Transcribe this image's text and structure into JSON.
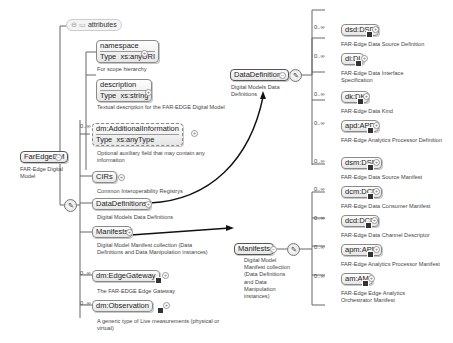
{
  "root": {
    "name": "FarEdgeDM",
    "doc": "FAR-Edge Digital Model"
  },
  "attributes": {
    "label": "attributes"
  },
  "root_children": [
    {
      "name": "namespace",
      "type_label": "Type",
      "type": "xs:anyURI",
      "doc": "For scope hierarchy",
      "occurs": ""
    },
    {
      "name": "description",
      "type_label": "Type",
      "type": "xs:string",
      "doc": "Textual description for the FAR-EDGE Digital Model",
      "occurs": ""
    },
    {
      "name": "dm:AdditionalInformation",
      "type_label": "Type",
      "type": "xs:anyType",
      "doc": "Optional auxiliary field that may contain any information",
      "occurs": "0..∞"
    },
    {
      "name": "CIRs",
      "doc": "Common Interoperability Registrys",
      "occurs": ""
    },
    {
      "name": "DataDefinitions",
      "doc": "Digital Models Data Definitions",
      "occurs": ""
    },
    {
      "name": "Manifests",
      "doc": "Digital Model Manifest collection (Data Definitions and Data Manipulation instances)",
      "occurs": ""
    },
    {
      "name": "dm:EdgeGateway",
      "doc": "The FAR-EDGE Edge Gateway",
      "occurs": "0..∞"
    },
    {
      "name": "dm:Observation",
      "doc": "A generic type of Live measurements (physical or virtual)",
      "occurs": "0..∞"
    }
  ],
  "data_definitions": {
    "name": "DataDefinitions",
    "doc": "Digital Models Data Definitions",
    "children": [
      {
        "name": "dsd:DSD",
        "doc": "FAR-Edge Data Source Definition",
        "occurs": "0..∞"
      },
      {
        "name": "di:DI",
        "doc": "FAR-Edge Data Interface Specification",
        "occurs": "0..∞"
      },
      {
        "name": "dk:DK",
        "doc": "FAR-Edge Data Kind",
        "occurs": "0..∞"
      },
      {
        "name": "apd:APD",
        "doc": "FAR-Edge Analytics Processor Definition",
        "occurs": "0..∞"
      }
    ]
  },
  "manifests": {
    "name": "Manifests",
    "doc": "Digital Model Manifest collection (Data Definitions and Data Manipulation instances)",
    "children": [
      {
        "name": "dsm:DSM",
        "doc": "FAR-Edge Data Source Manifest",
        "occurs": "0..∞"
      },
      {
        "name": "dcm:DCM",
        "doc": "FAR-Edge Data Consumer Manifest",
        "occurs": "0..∞"
      },
      {
        "name": "dcd:DCD",
        "doc": "FAR-Edge Data Channel Descriptor",
        "occurs": "0..∞"
      },
      {
        "name": "apm:APM",
        "doc": "FAR-Edge Analytics Processor Manifest",
        "occurs": "0..∞"
      },
      {
        "name": "am:AM",
        "doc": "FAR-Edge Edge Analytics Orchestrator Manifest",
        "occurs": "0..∞"
      }
    ]
  },
  "icons": {
    "sequence": "sequence-compositor-icon",
    "expand": "expand-plus-icon",
    "reference": "reference-arrow-icon"
  }
}
